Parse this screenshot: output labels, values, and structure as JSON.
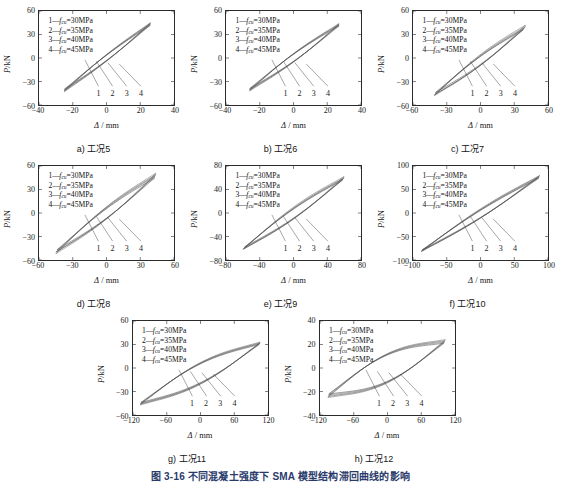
{
  "figure": {
    "title": "图 3-16  不同混凝土强度下 SMA 模型结构滞回曲线的影响",
    "legend_entries": [
      {
        "num": "1",
        "symbol": "f",
        "sub": "cu",
        "value": "=30MPa"
      },
      {
        "num": "2",
        "symbol": "f",
        "sub": "cu",
        "value": "=35MPa"
      },
      {
        "num": "3",
        "symbol": "f",
        "sub": "cu",
        "value": "=40MPa"
      },
      {
        "num": "4",
        "symbol": "f",
        "sub": "cu",
        "value": "=45MPa"
      }
    ],
    "axis_labels": {
      "x": "Δ / mm",
      "y": "P/kN",
      "x_sym": "Δ",
      "x_unit": "/ mm",
      "y_sym": "P",
      "y_unit": "/kN"
    },
    "leader_labels": [
      "1",
      "2",
      "3",
      "4"
    ]
  },
  "chart_data": [
    {
      "type": "line",
      "panel_id": "a",
      "caption": "a) 工况5",
      "title": "",
      "xlabel": "Δ / mm",
      "ylabel": "P/kN",
      "xlim": [
        -40,
        40
      ],
      "ylim": [
        -60,
        60
      ],
      "xticks": [
        -40,
        -20,
        0,
        20,
        40
      ],
      "yticks": [
        -60,
        -30,
        0,
        30,
        60
      ],
      "grid": false,
      "legend_position": "upper-left",
      "series": [
        {
          "name": "1—fcu=30MPa",
          "peak_disp": 26,
          "peak_force": 42,
          "neg_disp": -25,
          "neg_force": -40,
          "width_factor": 0.055
        },
        {
          "name": "2—fcu=35MPa",
          "peak_disp": 26,
          "peak_force": 43,
          "neg_disp": -25,
          "neg_force": -41,
          "width_factor": 0.06
        },
        {
          "name": "3—fcu=40MPa",
          "peak_disp": 26,
          "peak_force": 44,
          "neg_disp": -25,
          "neg_force": -42,
          "width_factor": 0.065
        },
        {
          "name": "4—fcu=45MPa",
          "peak_disp": 26,
          "peak_force": 45,
          "neg_disp": -25,
          "neg_force": -43,
          "width_factor": 0.07
        }
      ]
    },
    {
      "type": "line",
      "panel_id": "b",
      "caption": "b) 工况6",
      "title": "",
      "xlabel": "Δ / mm",
      "ylabel": "P/kN",
      "xlim": [
        -40,
        40
      ],
      "ylim": [
        -60,
        60
      ],
      "xticks": [
        -40,
        -20,
        0,
        20,
        40
      ],
      "yticks": [
        -60,
        -30,
        0,
        30,
        60
      ],
      "grid": false,
      "legend_position": "upper-left",
      "series": [
        {
          "name": "1—fcu=30MPa",
          "peak_disp": 27,
          "peak_force": 41,
          "neg_disp": -26,
          "neg_force": -39,
          "width_factor": 0.075
        },
        {
          "name": "2—fcu=35MPa",
          "peak_disp": 27,
          "peak_force": 42,
          "neg_disp": -26,
          "neg_force": -40,
          "width_factor": 0.08
        },
        {
          "name": "3—fcu=40MPa",
          "peak_disp": 27,
          "peak_force": 43,
          "neg_disp": -26,
          "neg_force": -41,
          "width_factor": 0.085
        },
        {
          "name": "4—fcu=45MPa",
          "peak_disp": 27,
          "peak_force": 44,
          "neg_disp": -26,
          "neg_force": -42,
          "width_factor": 0.09
        }
      ]
    },
    {
      "type": "line",
      "panel_id": "c",
      "caption": "c) 工况7",
      "title": "",
      "xlabel": "Δ / mm",
      "ylabel": "P/kN",
      "xlim": [
        -60,
        60
      ],
      "ylim": [
        -60,
        60
      ],
      "xticks": [
        -60,
        -30,
        0,
        30,
        60
      ],
      "yticks": [
        -60,
        -30,
        0,
        30,
        60
      ],
      "grid": false,
      "legend_position": "upper-left",
      "series": [
        {
          "name": "1—fcu=30MPa",
          "peak_disp": 38,
          "peak_force": 36,
          "neg_disp": -40,
          "neg_force": -44,
          "width_factor": 0.085
        },
        {
          "name": "2—fcu=35MPa",
          "peak_disp": 39,
          "peak_force": 38,
          "neg_disp": -40,
          "neg_force": -46,
          "width_factor": 0.095
        },
        {
          "name": "3—fcu=40MPa",
          "peak_disp": 40,
          "peak_force": 40,
          "neg_disp": -41,
          "neg_force": -47,
          "width_factor": 0.105
        },
        {
          "name": "4—fcu=45MPa",
          "peak_disp": 40,
          "peak_force": 42,
          "neg_disp": -41,
          "neg_force": -48,
          "width_factor": 0.115
        }
      ]
    },
    {
      "type": "line",
      "panel_id": "d",
      "caption": "d) 工况8",
      "title": "",
      "xlabel": "Δ / mm",
      "ylabel": "P/kN",
      "xlim": [
        -60,
        60
      ],
      "ylim": [
        -60,
        60
      ],
      "xticks": [
        -60,
        -30,
        0,
        30,
        60
      ],
      "yticks": [
        -60,
        -30,
        0,
        30,
        60
      ],
      "grid": false,
      "legend_position": "upper-left",
      "series": [
        {
          "name": "1—fcu=30MPa",
          "peak_disp": 43,
          "peak_force": 45,
          "neg_disp": -44,
          "neg_force": -47,
          "width_factor": 0.1
        },
        {
          "name": "2—fcu=35MPa",
          "peak_disp": 43,
          "peak_force": 47,
          "neg_disp": -44,
          "neg_force": -49,
          "width_factor": 0.11
        },
        {
          "name": "3—fcu=40MPa",
          "peak_disp": 44,
          "peak_force": 49,
          "neg_disp": -45,
          "neg_force": -50,
          "width_factor": 0.12
        },
        {
          "name": "4—fcu=45MPa",
          "peak_disp": 44,
          "peak_force": 51,
          "neg_disp": -45,
          "neg_force": -52,
          "width_factor": 0.13
        }
      ]
    },
    {
      "type": "line",
      "panel_id": "e",
      "caption": "e) 工况9",
      "title": "",
      "xlabel": "Δ / mm",
      "ylabel": "P/kN",
      "xlim": [
        -80,
        80
      ],
      "ylim": [
        -80,
        80
      ],
      "xticks": [
        -80,
        -40,
        0,
        40,
        80
      ],
      "yticks": [
        -80,
        -40,
        0,
        40,
        80
      ],
      "grid": false,
      "legend_position": "upper-left",
      "series": [
        {
          "name": "1—fcu=30MPa",
          "peak_disp": 58,
          "peak_force": 56,
          "neg_disp": -58,
          "neg_force": -58,
          "width_factor": 0.095
        },
        {
          "name": "2—fcu=35MPa",
          "peak_disp": 59,
          "peak_force": 58,
          "neg_disp": -59,
          "neg_force": -60,
          "width_factor": 0.105
        },
        {
          "name": "3—fcu=40MPa",
          "peak_disp": 60,
          "peak_force": 60,
          "neg_disp": -59,
          "neg_force": -61,
          "width_factor": 0.115
        },
        {
          "name": "4—fcu=45MPa",
          "peak_disp": 60,
          "peak_force": 62,
          "neg_disp": -60,
          "neg_force": -62,
          "width_factor": 0.125
        }
      ]
    },
    {
      "type": "line",
      "panel_id": "f",
      "caption": "f) 工况10",
      "title": "",
      "xlabel": "Δ / mm",
      "ylabel": "P/kN",
      "xlim": [
        -100,
        100
      ],
      "ylim": [
        -100,
        100
      ],
      "xticks": [
        -100,
        -50,
        0,
        50,
        100
      ],
      "yticks": [
        -100,
        -50,
        0,
        50,
        100
      ],
      "grid": false,
      "legend_position": "upper-left",
      "series": [
        {
          "name": "1—fcu=30MPa",
          "peak_disp": 86,
          "peak_force": 74,
          "neg_disp": -86,
          "neg_force": -78,
          "width_factor": 0.075
        },
        {
          "name": "2—fcu=35MPa",
          "peak_disp": 87,
          "peak_force": 76,
          "neg_disp": -87,
          "neg_force": -80,
          "width_factor": 0.082
        },
        {
          "name": "3—fcu=40MPa",
          "peak_disp": 87,
          "peak_force": 78,
          "neg_disp": -87,
          "neg_force": -81,
          "width_factor": 0.09
        },
        {
          "name": "4—fcu=45MPa",
          "peak_disp": 88,
          "peak_force": 80,
          "neg_disp": -88,
          "neg_force": -82,
          "width_factor": 0.098
        }
      ]
    },
    {
      "type": "line",
      "panel_id": "g",
      "caption": "g) 工况11",
      "title": "",
      "xlabel": "Δ / mm",
      "ylabel": "P/kN",
      "xlim": [
        -120,
        120
      ],
      "ylim": [
        -60,
        60
      ],
      "xticks": [
        -120,
        -60,
        0,
        60,
        120
      ],
      "yticks": [
        -60,
        -30,
        0,
        30,
        60
      ],
      "grid": false,
      "legend_position": "upper-left",
      "series": [
        {
          "name": "1—fcu=30MPa",
          "peak_disp": 104,
          "peak_force": 30,
          "neg_disp": -106,
          "neg_force": -44,
          "width_factor": 0.2
        },
        {
          "name": "2—fcu=35MPa",
          "peak_disp": 105,
          "peak_force": 31,
          "neg_disp": -106,
          "neg_force": -45,
          "width_factor": 0.21
        },
        {
          "name": "3—fcu=40MPa",
          "peak_disp": 106,
          "peak_force": 32,
          "neg_disp": -107,
          "neg_force": -46,
          "width_factor": 0.22
        },
        {
          "name": "4—fcu=45MPa",
          "peak_disp": 106,
          "peak_force": 33,
          "neg_disp": -107,
          "neg_force": -47,
          "width_factor": 0.23
        }
      ]
    },
    {
      "type": "line",
      "panel_id": "h",
      "caption": "h) 工况12",
      "title": "",
      "xlabel": "Δ / mm",
      "ylabel": "P/kN",
      "xlim": [
        -120,
        120
      ],
      "ylim": [
        -40,
        40
      ],
      "xticks": [
        -120,
        -60,
        0,
        60,
        120
      ],
      "yticks": [
        -40,
        -20,
        0,
        20,
        40
      ],
      "grid": false,
      "legend_position": "upper-left",
      "series": [
        {
          "name": "1—fcu=30MPa",
          "peak_disp": 100,
          "peak_force": 21,
          "neg_disp": -104,
          "neg_force": -22,
          "width_factor": 0.28
        },
        {
          "name": "2—fcu=35MPa",
          "peak_disp": 101,
          "peak_force": 22,
          "neg_disp": -105,
          "neg_force": -23,
          "width_factor": 0.29
        },
        {
          "name": "3—fcu=40MPa",
          "peak_disp": 102,
          "peak_force": 23,
          "neg_disp": -105,
          "neg_force": -24,
          "width_factor": 0.3
        },
        {
          "name": "4—fcu=45MPa",
          "peak_disp": 103,
          "peak_force": 24,
          "neg_disp": -106,
          "neg_force": -25,
          "width_factor": 0.31
        }
      ]
    }
  ],
  "style": {
    "curve_color": "#5a5a5a",
    "curve_color_dark": "#3a3a3a",
    "axis_color": "#2b2b2b",
    "title_color": "#2a3b6b"
  }
}
